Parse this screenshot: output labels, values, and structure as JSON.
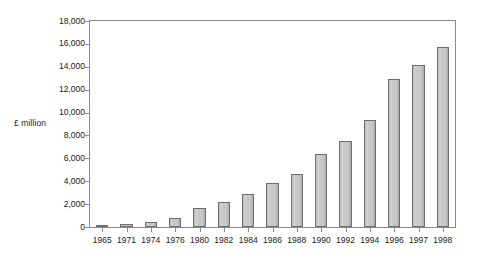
{
  "chart_data": {
    "type": "bar",
    "title": "",
    "subtitle": "",
    "xlabel": "",
    "ylabel": "£ million",
    "categories": [
      "1965",
      "1971",
      "1974",
      "1976",
      "1980",
      "1982",
      "1984",
      "1986",
      "1988",
      "1990",
      "1992",
      "1994",
      "1996",
      "1997",
      "1998"
    ],
    "values": [
      120,
      270,
      470,
      800,
      1650,
      2150,
      2900,
      3850,
      4600,
      6400,
      7500,
      9350,
      12900,
      14200,
      15700
    ],
    "ylim": [
      0,
      18000
    ],
    "y_ticks": [
      0,
      2000,
      4000,
      6000,
      8000,
      10000,
      12000,
      14000,
      16000,
      18000
    ],
    "y_tick_labels": [
      "0",
      "2,000",
      "4,000",
      "6,000",
      "8,000",
      "10,000",
      "12,000",
      "14,000",
      "16,000",
      "18,000"
    ],
    "grid": false,
    "legend": null,
    "legend_position": "none",
    "bar_fill_color": "#c8c8c8",
    "bar_border_color": "#6e6e6e",
    "axis_color": "#8a8a8a",
    "background_color": "#ffffff",
    "text_color": "#1a1a1a"
  }
}
